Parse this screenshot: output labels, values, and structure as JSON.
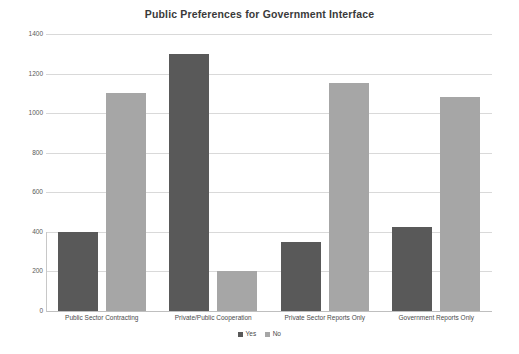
{
  "chart_data": {
    "type": "bar",
    "title": "Public Preferences for Government Interface",
    "xlabel": "",
    "ylabel": "",
    "categories": [
      "Public Sector Contracting",
      "Private/Public Cooperation",
      "Private Sector Reports Only",
      "Government Reports Only"
    ],
    "series": [
      {
        "name": "Yes",
        "color": "#595959",
        "values": [
          400,
          1300,
          350,
          425
        ]
      },
      {
        "name": "No",
        "color": "#a6a6a6",
        "values": [
          1100,
          200,
          1150,
          1080
        ]
      }
    ],
    "ylim": [
      0,
      1400
    ],
    "yticks": [
      0,
      200,
      400,
      600,
      800,
      1000,
      1200,
      1400
    ],
    "ytick_labels": [
      "0",
      "200",
      "400",
      "600",
      "800",
      "1000",
      "1200",
      "1400"
    ],
    "grid": true,
    "legend_position": "bottom",
    "legend_entries": [
      "Yes",
      "No"
    ]
  }
}
